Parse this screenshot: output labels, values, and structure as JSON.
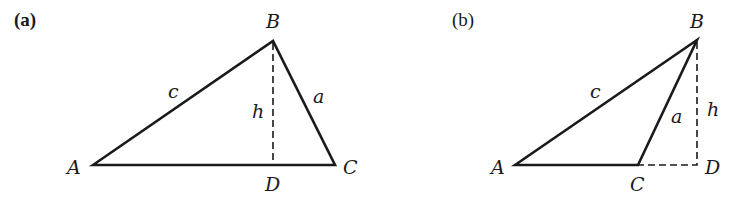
{
  "figure": {
    "panels": [
      {
        "id": "a",
        "label": "(a)",
        "vertices": {
          "A": {
            "label": "A",
            "x": 93,
            "y": 165
          },
          "B": {
            "label": "B",
            "x": 273,
            "y": 41
          },
          "C": {
            "label": "C",
            "x": 335,
            "y": 165
          },
          "D": {
            "label": "D",
            "x": 273,
            "y": 165
          }
        },
        "sides": {
          "c": "c",
          "a": "a",
          "h": "h"
        },
        "description": "Acute triangle ABC with altitude h from B dropped to D on side AC (inside the triangle)"
      },
      {
        "id": "b",
        "label": "(b)",
        "vertices": {
          "A": {
            "label": "A",
            "x": 515,
            "y": 165
          },
          "B": {
            "label": "B",
            "x": 697,
            "y": 40
          },
          "C": {
            "label": "C",
            "x": 638,
            "y": 165
          },
          "D": {
            "label": "D",
            "x": 697,
            "y": 165
          }
        },
        "sides": {
          "c": "c",
          "a": "a",
          "h": "h"
        },
        "description": "Obtuse triangle ABC with altitude h from B dropped to D on the extension of AC beyond C"
      }
    ]
  },
  "colors": {
    "stroke": "#1a1a1a",
    "background": "#ffffff"
  }
}
